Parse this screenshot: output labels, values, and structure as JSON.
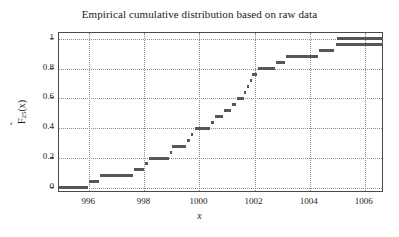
{
  "chart_data": {
    "type": "line",
    "title": "Empirical cumulative distribution based on raw data",
    "xlabel": "x",
    "ylabel_text": "F",
    "ylabel_sub": "25",
    "ylabel_arg": "(x)",
    "ylabel_full": "F̂25(x)",
    "xlim": [
      994.9,
      1006.7
    ],
    "ylim": [
      -0.035,
      1.04
    ],
    "grid": true,
    "legend": null,
    "xticks": [
      996,
      998,
      1000,
      1002,
      1004,
      1006
    ],
    "xtick_labels": [
      "996",
      "998",
      "1000",
      "1002",
      "1004",
      "1006"
    ],
    "yticks": [
      0,
      0.2,
      0.4,
      0.6,
      0.8,
      1
    ],
    "ytick_labels": [
      "0",
      "0.2",
      "0.4",
      "0.6",
      "0.8",
      "1"
    ],
    "series_name": "Empirical CDF F̂25(x)",
    "n_observations": 25,
    "steps": [
      {
        "x_start": 994.9,
        "x_end": 995.95,
        "y": 0.0
      },
      {
        "x_start": 995.98,
        "x_end": 996.35,
        "y": 0.04
      },
      {
        "x_start": 996.38,
        "x_end": 997.6,
        "y": 0.08
      },
      {
        "x_start": 997.63,
        "x_end": 998.0,
        "y": 0.12
      },
      {
        "x_start": 998.02,
        "x_end": 998.12,
        "y": 0.16
      },
      {
        "x_start": 998.15,
        "x_end": 998.9,
        "y": 0.2
      },
      {
        "x_start": 998.92,
        "x_end": 999.0,
        "y": 0.24
      },
      {
        "x_start": 999.02,
        "x_end": 999.5,
        "y": 0.28
      },
      {
        "x_start": 999.55,
        "x_end": 999.65,
        "y": 0.32
      },
      {
        "x_start": 999.68,
        "x_end": 999.78,
        "y": 0.36
      },
      {
        "x_start": 999.82,
        "x_end": 1000.4,
        "y": 0.4
      },
      {
        "x_start": 1000.42,
        "x_end": 1000.52,
        "y": 0.44
      },
      {
        "x_start": 1000.55,
        "x_end": 1000.85,
        "y": 0.48
      },
      {
        "x_start": 1000.88,
        "x_end": 1001.15,
        "y": 0.52
      },
      {
        "x_start": 1001.18,
        "x_end": 1001.32,
        "y": 0.56
      },
      {
        "x_start": 1001.35,
        "x_end": 1001.6,
        "y": 0.6
      },
      {
        "x_start": 1001.62,
        "x_end": 1001.7,
        "y": 0.64
      },
      {
        "x_start": 1001.72,
        "x_end": 1001.8,
        "y": 0.68
      },
      {
        "x_start": 1001.82,
        "x_end": 1001.9,
        "y": 0.72
      },
      {
        "x_start": 1001.92,
        "x_end": 1002.1,
        "y": 0.76
      },
      {
        "x_start": 1002.12,
        "x_end": 1002.75,
        "y": 0.8
      },
      {
        "x_start": 1002.78,
        "x_end": 1003.1,
        "y": 0.84
      },
      {
        "x_start": 1003.15,
        "x_end": 1004.3,
        "y": 0.88
      },
      {
        "x_start": 1004.35,
        "x_end": 1004.9,
        "y": 0.92
      },
      {
        "x_start": 1004.95,
        "x_end": 1006.65,
        "y": 0.96
      },
      {
        "x_start": 1004.98,
        "x_end": 1006.65,
        "y": 1.0
      }
    ]
  }
}
